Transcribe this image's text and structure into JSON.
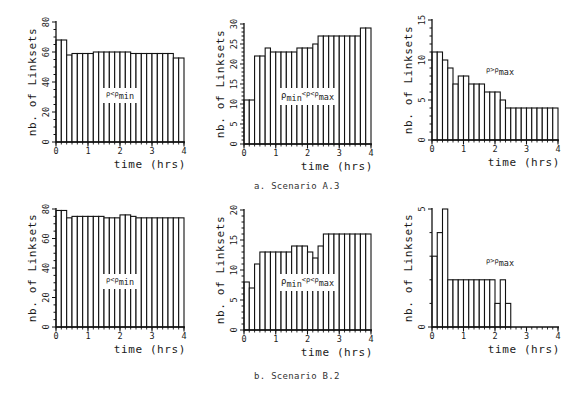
{
  "figure": {
    "captions": [
      "a. Scenario A.3",
      "b. Scenario B.2"
    ]
  },
  "chart_data": [
    {
      "id": "A3-low",
      "row": 0,
      "col": 0,
      "type": "bar",
      "title": "",
      "annotation": {
        "base": "ρ<ρ",
        "sub": "min",
        "prefix_sub": "",
        "mid": ""
      },
      "xlabel": "time (hrs)",
      "ylabel": "nb. of Linksets",
      "xlim": [
        0,
        4
      ],
      "ylim": [
        0,
        80
      ],
      "xticks": [
        0,
        1,
        2,
        3,
        4
      ],
      "yticks": [
        0,
        20,
        40,
        60,
        80
      ],
      "yminor": 4,
      "bin_width_hrs": 0.1667,
      "values": [
        68,
        68,
        58,
        59,
        59,
        59,
        59,
        60,
        60,
        60,
        60,
        60,
        60,
        60,
        59,
        59,
        59,
        59,
        59,
        59,
        59,
        59,
        56,
        56
      ]
    },
    {
      "id": "A3-mid",
      "row": 0,
      "col": 1,
      "type": "bar",
      "title": "",
      "annotation": {
        "prefix": "ρ",
        "prefix_sub": "min",
        "mid": "<ρ<ρ",
        "sub": "max"
      },
      "xlabel": "time (hrs)",
      "ylabel": "nb. of Linksets",
      "xlim": [
        0,
        4
      ],
      "ylim": [
        0,
        30
      ],
      "xticks": [
        0,
        1,
        2,
        3,
        4
      ],
      "yticks": [
        0,
        5,
        10,
        15,
        20,
        25,
        30
      ],
      "yminor": 5,
      "bin_width_hrs": 0.1667,
      "values": [
        11,
        11,
        22,
        22,
        24,
        23,
        23,
        23,
        23,
        23,
        24,
        24,
        24,
        25,
        27,
        27,
        27,
        27,
        27,
        27,
        27,
        27,
        29,
        29
      ]
    },
    {
      "id": "A3-high",
      "row": 0,
      "col": 2,
      "type": "bar",
      "title": "",
      "annotation": {
        "base": "ρ>ρ",
        "sub": "max",
        "prefix_sub": "",
        "mid": ""
      },
      "xlabel": "time (hrs)",
      "ylabel": "nb. of Linksets",
      "xlim": [
        0,
        4
      ],
      "ylim": [
        0,
        15
      ],
      "xticks": [
        0,
        1,
        2,
        3,
        4
      ],
      "yticks": [
        0,
        5,
        10,
        15
      ],
      "yminor": 5,
      "bin_width_hrs": 0.1667,
      "values": [
        11,
        11,
        10,
        9,
        7,
        8,
        8,
        7,
        7,
        7,
        6,
        6,
        6,
        5,
        4,
        4,
        4,
        4,
        4,
        4,
        4,
        4,
        4,
        4
      ]
    },
    {
      "id": "B2-low",
      "row": 1,
      "col": 0,
      "type": "bar",
      "title": "",
      "annotation": {
        "base": "ρ<ρ",
        "sub": "min",
        "prefix_sub": "",
        "mid": ""
      },
      "xlabel": "time (hrs)",
      "ylabel": "nb. of Linksets",
      "xlim": [
        0,
        4
      ],
      "ylim": [
        0,
        80
      ],
      "xticks": [
        0,
        1,
        2,
        3,
        4
      ],
      "yticks": [
        0,
        20,
        40,
        60,
        80
      ],
      "yminor": 4,
      "bin_width_hrs": 0.1667,
      "values": [
        79,
        79,
        74,
        75,
        75,
        75,
        75,
        75,
        75,
        74,
        74,
        74,
        76,
        76,
        75,
        74,
        74,
        74,
        74,
        74,
        74,
        74,
        74,
        74
      ]
    },
    {
      "id": "B2-mid",
      "row": 1,
      "col": 1,
      "type": "bar",
      "title": "",
      "annotation": {
        "prefix": "ρ",
        "prefix_sub": "min",
        "mid": "<ρ<ρ",
        "sub": "max"
      },
      "xlabel": "time (hrs)",
      "ylabel": "nb. of Linksets",
      "xlim": [
        0,
        4
      ],
      "ylim": [
        0,
        20
      ],
      "xticks": [
        0,
        1,
        2,
        3,
        4
      ],
      "yticks": [
        0,
        5,
        10,
        15,
        20
      ],
      "yminor": 5,
      "bin_width_hrs": 0.1667,
      "values": [
        8,
        7,
        11,
        13,
        13,
        13,
        13,
        13,
        13,
        14,
        14,
        14,
        13,
        12,
        14,
        16,
        16,
        16,
        16,
        16,
        16,
        16,
        16,
        16
      ]
    },
    {
      "id": "B2-high",
      "row": 1,
      "col": 2,
      "type": "bar",
      "title": "",
      "annotation": {
        "base": "ρ>ρ",
        "sub": "max",
        "prefix_sub": "",
        "mid": ""
      },
      "xlabel": "time (hrs)",
      "ylabel": "nb. of Linksets",
      "xlim": [
        0,
        4
      ],
      "ylim": [
        0,
        5
      ],
      "xticks": [
        0,
        1,
        2,
        3,
        4
      ],
      "yticks": [
        0,
        5
      ],
      "ytick_marks": [
        0,
        1,
        2,
        3,
        4,
        5
      ],
      "yminor": 1,
      "bin_width_hrs": 0.1667,
      "values": [
        3,
        4,
        5,
        2,
        2,
        2,
        2,
        2,
        2,
        2,
        2,
        2,
        1,
        2,
        1,
        0,
        0,
        0,
        0,
        0,
        0,
        0,
        0,
        0
      ]
    }
  ]
}
